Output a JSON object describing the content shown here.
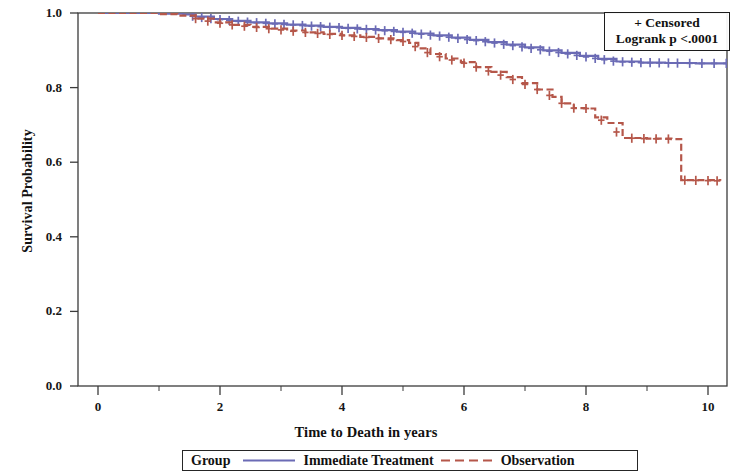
{
  "chart_data": {
    "type": "line",
    "subtype": "kaplan-meier-survival",
    "title": "",
    "xlabel": "Time to Death in years",
    "ylabel": "Survival Probability",
    "xlim": [
      0,
      10.6
    ],
    "ylim": [
      0.0,
      1.0
    ],
    "xticks": [
      0,
      2,
      4,
      6,
      8,
      10
    ],
    "xtick_labels": [
      "0",
      "2",
      "4",
      "6",
      "8",
      "10"
    ],
    "xminor_ticks": [
      1,
      3,
      5,
      7,
      9
    ],
    "yticks": [
      0.0,
      0.2,
      0.4,
      0.6,
      0.8,
      1.0
    ],
    "ytick_labels": [
      "0.0",
      "0.2",
      "0.4",
      "0.6",
      "0.8",
      "1.0"
    ],
    "grid": false,
    "legend_position": "bottom",
    "censor_marker": "+",
    "series": [
      {
        "name": "Immediate Treatment",
        "color": "#6b6bb5",
        "linestyle": "solid",
        "x": [
          0,
          0.6,
          1.0,
          1.4,
          1.6,
          1.9,
          2.2,
          2.5,
          2.8,
          3.1,
          3.4,
          3.7,
          4.0,
          4.3,
          4.6,
          4.9,
          5.2,
          5.5,
          5.8,
          6.1,
          6.4,
          6.7,
          7.0,
          7.3,
          7.6,
          7.9,
          8.2,
          8.5,
          8.9,
          9.3,
          9.8,
          10.35
        ],
        "y": [
          1.0,
          1.0,
          0.998,
          0.996,
          0.99,
          0.984,
          0.979,
          0.975,
          0.972,
          0.969,
          0.966,
          0.963,
          0.96,
          0.957,
          0.954,
          0.95,
          0.945,
          0.94,
          0.934,
          0.928,
          0.922,
          0.915,
          0.908,
          0.9,
          0.893,
          0.885,
          0.877,
          0.87,
          0.867,
          0.866,
          0.865,
          0.865
        ],
        "censor_x": [
          1.55,
          1.7,
          1.85,
          2.0,
          2.15,
          2.3,
          2.45,
          2.6,
          2.75,
          2.9,
          3.05,
          3.2,
          3.35,
          3.5,
          3.65,
          3.8,
          3.95,
          4.1,
          4.25,
          4.4,
          4.55,
          4.7,
          4.85,
          5.0,
          5.15,
          5.3,
          5.45,
          5.6,
          5.75,
          5.9,
          6.05,
          6.2,
          6.35,
          6.5,
          6.65,
          6.8,
          6.95,
          7.1,
          7.25,
          7.4,
          7.55,
          7.7,
          7.85,
          8.0,
          8.15,
          8.3,
          8.45,
          8.6,
          8.75,
          8.9,
          9.05,
          9.2,
          9.35,
          9.5,
          9.7,
          9.9,
          10.1,
          10.3
        ]
      },
      {
        "name": "Observation",
        "color": "#b5574a",
        "linestyle": "dashed",
        "x": [
          0,
          0.6,
          1.0,
          1.3,
          1.6,
          1.9,
          2.2,
          2.5,
          2.8,
          3.1,
          3.4,
          3.7,
          4.0,
          4.3,
          4.6,
          4.9,
          5.1,
          5.25,
          5.45,
          5.7,
          5.95,
          6.2,
          6.45,
          6.7,
          6.95,
          7.2,
          7.45,
          7.6,
          7.8,
          8.0,
          8.15,
          8.35,
          8.6,
          9.0,
          9.4,
          9.52,
          9.56,
          10.2
        ],
        "y": [
          1.0,
          1.0,
          0.997,
          0.993,
          0.985,
          0.975,
          0.968,
          0.963,
          0.958,
          0.953,
          0.948,
          0.944,
          0.94,
          0.936,
          0.932,
          0.927,
          0.92,
          0.905,
          0.89,
          0.878,
          0.868,
          0.855,
          0.842,
          0.828,
          0.812,
          0.795,
          0.775,
          0.758,
          0.745,
          0.744,
          0.72,
          0.705,
          0.665,
          0.663,
          0.662,
          0.662,
          0.552,
          0.55
        ],
        "censor_x": [
          1.6,
          1.8,
          2.0,
          2.2,
          2.4,
          2.6,
          2.8,
          3.0,
          3.2,
          3.4,
          3.6,
          3.8,
          4.0,
          4.2,
          4.4,
          4.6,
          4.8,
          5.0,
          5.2,
          5.4,
          5.6,
          5.8,
          6.0,
          6.2,
          6.4,
          6.6,
          6.8,
          7.0,
          7.2,
          7.4,
          7.6,
          7.8,
          8.0,
          8.25,
          8.5,
          8.75,
          8.95,
          9.15,
          9.35,
          9.62,
          9.8,
          10.0,
          10.15
        ]
      }
    ],
    "annotations": {
      "censored_note": "+ Censored",
      "logrank": "Logrank p <.0001"
    }
  },
  "stat_legend": {
    "censored_label": "+ Censored",
    "logrank_label": "Logrank p <.0001"
  },
  "group_legend": {
    "title": "Group",
    "entries": [
      {
        "label": "Immediate Treatment",
        "color": "#6b6bb5",
        "style": "solid"
      },
      {
        "label": "Observation",
        "color": "#b5574a",
        "style": "dashed"
      }
    ]
  },
  "axes": {
    "x_title": "Time to Death in years",
    "y_title": "Survival Probability"
  }
}
